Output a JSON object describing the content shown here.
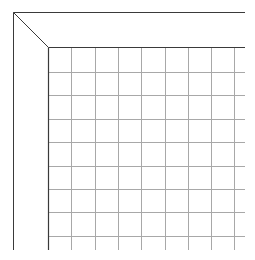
{
  "diagram": {
    "type": "perspective-grid-corner",
    "colors": {
      "background": "#ffffff",
      "frame_line": "#3a3a3a",
      "grid_line": "#a8a8a8"
    },
    "outer_corner": {
      "x": 13,
      "y": 12
    },
    "inner_corner": {
      "x": 48,
      "y": 47
    },
    "top_edge_end_x": 245,
    "bottom_edge_y": 250,
    "grid": {
      "vertical_x": [
        71,
        95,
        118,
        141,
        165,
        188,
        211,
        234
      ],
      "horizontal_y": [
        72,
        95,
        119,
        142,
        166,
        189,
        212,
        236
      ]
    }
  }
}
